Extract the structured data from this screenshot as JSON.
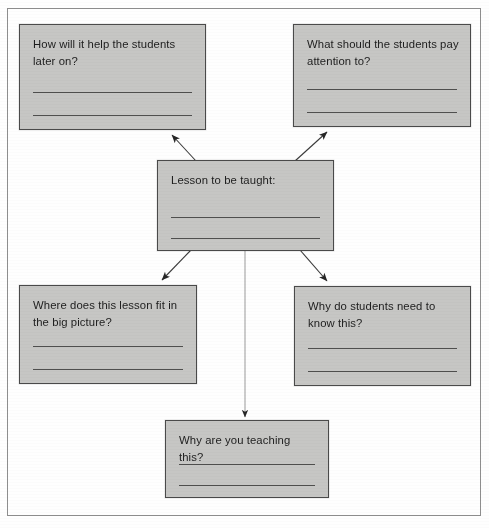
{
  "diagram": {
    "fill_color": "#c6c6c4",
    "border_color": "#4a4a4a",
    "text_color": "#1d1d1d",
    "frame_color": "#8e8e8e",
    "nodes": [
      {
        "id": "how-will-it-help",
        "question": "How will it help the students\nlater on?",
        "answer_line_1": "",
        "answer_line_2": ""
      },
      {
        "id": "what-should-they-notice",
        "question": "What should the students pay\nattention to?",
        "answer_line_1": "",
        "answer_line_2": ""
      },
      {
        "id": "lesson-to-be-taught",
        "question": "Lesson to be taught:",
        "answer_line_1": "",
        "answer_line_2": ""
      },
      {
        "id": "where-does-it-fit",
        "question": "Where does this lesson fit in\nthe big picture?",
        "answer_line_1": "",
        "answer_line_2": ""
      },
      {
        "id": "why-do-students-need-it",
        "question": "Why do students need to\nknow this?",
        "answer_line_1": "",
        "answer_line_2": ""
      },
      {
        "id": "why-are-you-teaching-it",
        "question": "Why are you teaching this?",
        "answer_line_1": "",
        "answer_line_2": ""
      }
    ],
    "connectors": [
      {
        "id": "center-to-how-will-it-help",
        "direction": "up-left"
      },
      {
        "id": "center-to-what-should-they-notice",
        "direction": "up-right"
      },
      {
        "id": "center-to-where-does-it-fit",
        "direction": "down-left"
      },
      {
        "id": "center-to-why-do-students-need-it",
        "direction": "down-right"
      },
      {
        "id": "center-to-why-are-you-teaching-it",
        "direction": "down"
      }
    ]
  }
}
